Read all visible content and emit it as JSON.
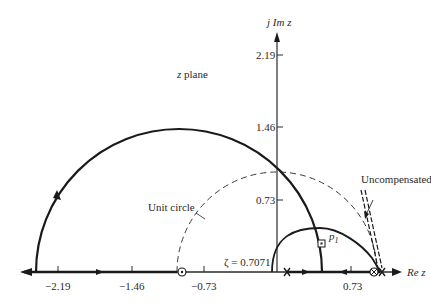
{
  "plane_label": "z plane",
  "axes": {
    "x_label": "Re z",
    "y_label": "j Im z",
    "x_ticks": [
      {
        "value": -2.19,
        "label": "−2.19"
      },
      {
        "value": -1.46,
        "label": "−1.46"
      },
      {
        "value": -0.73,
        "label": "−0.73"
      },
      {
        "value": 0.73,
        "label": "0.73"
      }
    ],
    "y_ticks": [
      {
        "value": 0.73,
        "label": "0.73"
      },
      {
        "value": 1.46,
        "label": "1.46"
      },
      {
        "value": 2.19,
        "label": "2.19"
      }
    ]
  },
  "annotations": {
    "unit_circle": "Unit circle",
    "uncompensated": "Uncompensated",
    "zeta": "ζ = 0.7071",
    "pole_label": "p",
    "pole_subscript": "1"
  },
  "colors": {
    "locus": "#1a1a1a",
    "axis": "#2a2a2a",
    "dashed": "#3a3a3a",
    "background": "#ffffff"
  }
}
